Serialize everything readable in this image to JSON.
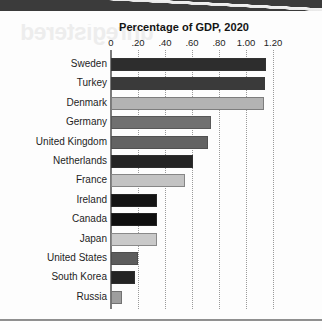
{
  "page": {
    "ghost_text": "unregistered",
    "top_band_color": "#3b3b3b",
    "background_color": "#fdfdfd"
  },
  "chart_data": {
    "type": "bar",
    "orientation": "horizontal",
    "title": "Percentage of GDP, 2020",
    "xlabel": "",
    "ylabel": "",
    "xlim": [
      0,
      1.2
    ],
    "grid": true,
    "legend": null,
    "tick_labels": [
      "0",
      ".20",
      ".40",
      ".60",
      ".80",
      "1.00",
      "1.20"
    ],
    "tick_values": [
      0,
      0.2,
      0.4,
      0.6,
      0.8,
      1.0,
      1.2
    ],
    "categories": [
      "Sweden",
      "Turkey",
      "Denmark",
      "Germany",
      "United Kingdom",
      "Netherlands",
      "France",
      "Ireland",
      "Canada",
      "Japan",
      "United States",
      "South Korea",
      "Russia"
    ],
    "values": [
      1.15,
      1.14,
      1.13,
      0.74,
      0.72,
      0.61,
      0.55,
      0.34,
      0.34,
      0.34,
      0.2,
      0.18,
      0.08
    ],
    "bar_colors": [
      "#2d2d2d",
      "#3a3a3a",
      "#b3b3b3",
      "#707070",
      "#636363",
      "#242424",
      "#c3c3c3",
      "#141414",
      "#0f0f0f",
      "#c9c9c9",
      "#5c5c5c",
      "#242424",
      "#9e9e9e"
    ]
  }
}
